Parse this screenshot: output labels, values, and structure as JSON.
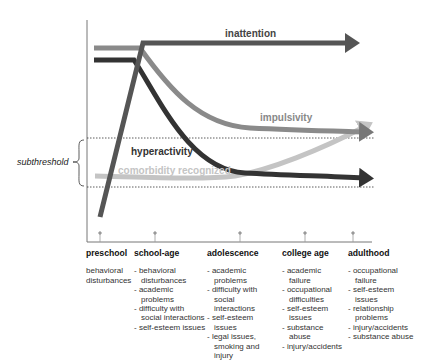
{
  "diagram": {
    "curve_labels": {
      "inattention": "inattention",
      "impulsivity": "impulsivity",
      "hyperactivity": "hyperactivity",
      "comorbidity": "comorbidity recognized"
    },
    "threshold_label": "subthreshold",
    "colors": {
      "inattention": "#555555",
      "impulsivity": "#8a8a8a",
      "hyperactivity": "#333333",
      "comorbidity": "#c4c4c4",
      "axis": "#777777"
    }
  },
  "stages": [
    {
      "title": "preschool",
      "bulleted": false,
      "items": [
        "behavioral disturbances"
      ]
    },
    {
      "title": "school-age",
      "bulleted": true,
      "items": [
        "behavioral disturbances",
        "academic problems",
        "difficulty with social interactions",
        "self-esteem issues"
      ]
    },
    {
      "title": "adolescence",
      "bulleted": true,
      "items": [
        "academic problems",
        "difficulty with social interactions",
        "self-esteem issues",
        "legal issues, smoking and injury"
      ]
    },
    {
      "title": "college age",
      "bulleted": true,
      "items": [
        "academic failure",
        "occupational difficulties",
        "self-esteem issues",
        "substance abuse",
        "injury/accidents"
      ]
    },
    {
      "title": "adulthood",
      "bulleted": true,
      "items": [
        "occupational failure",
        "self-esteem issues",
        "relationship problems",
        "injury/accidents",
        "substance abuse"
      ]
    }
  ]
}
